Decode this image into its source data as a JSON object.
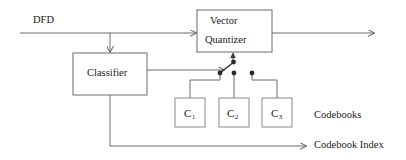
{
  "figure": {
    "type": "block-diagram",
    "title_visible": false,
    "background_color": "#ffffff",
    "line_color": "#5a5a5a",
    "text_color": "#1a1a1a"
  },
  "labels": {
    "input_signal": "DFD",
    "codebooks_group": "Codebooks",
    "codebook_index_output": "Codebook Index"
  },
  "blocks": {
    "vector_quantizer": {
      "line1": "Vector",
      "line2": "Quantizer"
    },
    "classifier": {
      "name": "Classifier"
    },
    "codebooks": [
      {
        "base": "C",
        "subscript": "1"
      },
      {
        "base": "C",
        "subscript": "2"
      },
      {
        "base": "C",
        "subscript": "3"
      }
    ]
  },
  "switch": {
    "name": "codebook-selector-switch",
    "contact_count": 3,
    "selected_contact": 1
  }
}
